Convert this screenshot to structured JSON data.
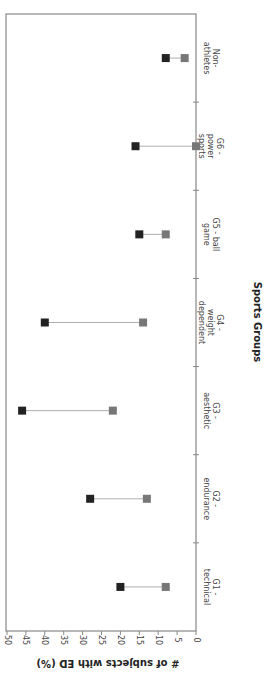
{
  "chart_data": {
    "type": "scatter",
    "subtype": "dumbbell",
    "orientation": "rotated-90",
    "title": "",
    "xlabel": "Sports Groups",
    "ylabel": "# of subjects with ED (%)",
    "ylim": [
      0,
      50
    ],
    "yticks": [
      0,
      5,
      10,
      15,
      20,
      25,
      30,
      35,
      40,
      45,
      50
    ],
    "grid": false,
    "legend": null,
    "categories": [
      [
        "G1 -",
        "technical"
      ],
      [
        "G2 -",
        "endurance"
      ],
      [
        "G3 -",
        "aesthetic"
      ],
      [
        "G4 -",
        "weight",
        "dependent"
      ],
      [
        "G5 - ball",
        "game"
      ],
      [
        "G6 -",
        "power",
        "sports"
      ],
      [
        "Non-",
        "athletes"
      ]
    ],
    "series": [
      {
        "name": "dark",
        "color": "#222222",
        "values": [
          20,
          28,
          46,
          40,
          15,
          16,
          8
        ]
      },
      {
        "name": "gray",
        "color": "#777777",
        "values": [
          8,
          13,
          22,
          14,
          8,
          0,
          3
        ]
      }
    ]
  }
}
